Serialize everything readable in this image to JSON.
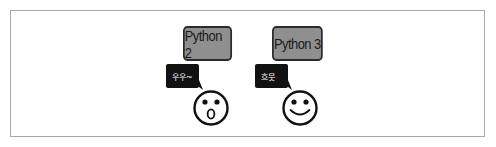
{
  "figure": {
    "frame_border_color": "#a8a8a8"
  },
  "panels": [
    {
      "version_label": "Python 2",
      "speech_text": "우우~",
      "face_expression": "surprised",
      "box_color": "#8f8f8f",
      "bubble_color": "#111111"
    },
    {
      "version_label": "Python 3",
      "speech_text": "흐뭇",
      "face_expression": "smiling",
      "box_color": "#8f8f8f",
      "bubble_color": "#111111"
    }
  ]
}
